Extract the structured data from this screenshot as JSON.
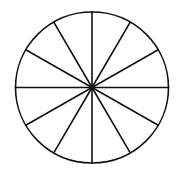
{
  "diagram": {
    "type": "divided-circle",
    "sectors": 12,
    "sector_angle_deg": 30,
    "center": {
      "x": 92,
      "y": 87.5
    },
    "radius_x": 76.5,
    "radius_y": 75.5,
    "stroke_color": "#111111",
    "fill_color": "#ffffff",
    "stroke_width": 1.6,
    "center_dot_radius": 2.2
  }
}
